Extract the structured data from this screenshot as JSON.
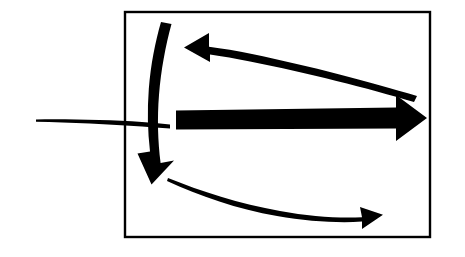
{
  "figure": {
    "kind": "black-and-white-arrow-diagram",
    "background_color": "#ffffff",
    "ink_color": "#000000",
    "canvas": {
      "width": 465,
      "height": 257
    },
    "frame": {
      "name": "bounding-rectangle",
      "x": 124,
      "y": 11,
      "width": 307,
      "height": 227,
      "stroke_color": "#000000",
      "stroke_width": 2,
      "fill": "none"
    },
    "elements": [
      {
        "id": "inflow-line",
        "label": "incoming horizontal line entering the box from the left",
        "type": "line",
        "direction": "left-to-right",
        "has_arrowhead": false,
        "start": [
          36,
          120
        ],
        "end": [
          170,
          124
        ]
      },
      {
        "id": "down-arrow",
        "label": "thick curved arrow pointing down-left inside the box",
        "type": "arrow",
        "direction": "down",
        "has_arrowhead": true,
        "arrowhead_at": [
          152,
          182
        ]
      },
      {
        "id": "upper-left-arrow",
        "label": "thick tapered arrow pointing left near the top of the box",
        "type": "arrow",
        "direction": "left",
        "has_arrowhead": true,
        "arrowhead_at": [
          185,
          46
        ]
      },
      {
        "id": "right-arrow",
        "label": "thick straight arrow pointing right across the middle of the box",
        "type": "arrow",
        "direction": "right",
        "has_arrowhead": true,
        "arrowhead_at": [
          425,
          118
        ]
      },
      {
        "id": "lower-right-arrow",
        "label": "thin-to-thick curved arrow sweeping right along the bottom of the box",
        "type": "arrow",
        "direction": "right",
        "has_arrowhead": true,
        "arrowhead_at": [
          378,
          215
        ]
      }
    ]
  },
  "caption": {
    "text": "",
    "visible": false
  }
}
